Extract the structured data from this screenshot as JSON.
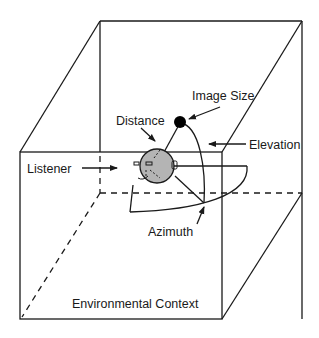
{
  "diagram": {
    "labels": {
      "image_size": "Image Size",
      "distance": "Distance",
      "elevation": "Elevation",
      "listener": "Listener",
      "azimuth": "Azimuth",
      "environment": "Environmental Context"
    },
    "colors": {
      "line": "#1a1a1a",
      "head_fill": "#b4b4b4",
      "source_fill": "#000000",
      "background": "#ffffff"
    },
    "elements": [
      "room-cube",
      "listener-head",
      "sound-source",
      "azimuth-arc",
      "elevation-arc",
      "distance-line"
    ]
  }
}
